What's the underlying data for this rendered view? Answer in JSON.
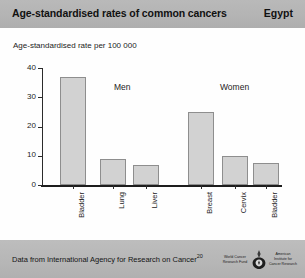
{
  "header": {
    "title": "Age-standardised rates of common cancers",
    "country": "Egypt"
  },
  "footer": {
    "note_text": "Data from International Agency for Research on Cancer",
    "note_superscript": "20",
    "logo_left": "World Cancer Research Fund",
    "logo_right": "American Institute for Cancer Research",
    "logo_emblem_name": "wcrf-aicr-emblem"
  },
  "colors": {
    "header_band": "#b4b4b4",
    "footer_band": "#b6b6b6",
    "bar_fill": "#d2d2d2",
    "bar_border": "#8e8e8e",
    "axis": "#2b2b2b",
    "plot_background": "#fefefe"
  },
  "chart_data": {
    "type": "bar",
    "title": "Age-standardised rates of common cancers",
    "subtitle": "Egypt",
    "ylabel": "Age-standardised rate per 100 000",
    "xlabel": "",
    "ylim": [
      0,
      40
    ],
    "yticks": [
      0,
      10,
      20,
      30,
      40
    ],
    "ytick_labels": [
      "0",
      "10",
      "20",
      "30",
      "40"
    ],
    "grid": false,
    "legend": "none",
    "group_labels": [
      "Men",
      "Women"
    ],
    "categories": [
      "Bladder",
      "Lung",
      "Liver",
      "Breast",
      "Cervix",
      "Bladder"
    ],
    "values": [
      37,
      9,
      7,
      25,
      10,
      7.5
    ],
    "groups": [
      {
        "name": "Men",
        "categories": [
          "Bladder",
          "Lung",
          "Liver"
        ],
        "values": [
          37,
          9,
          7
        ]
      },
      {
        "name": "Women",
        "categories": [
          "Breast",
          "Cervix",
          "Bladder"
        ],
        "values": [
          25,
          10,
          7.5
        ]
      }
    ],
    "bars": [
      {
        "label": "Bladder",
        "value": 37,
        "group": "Men",
        "x": 18
      },
      {
        "label": "Lung",
        "value": 9,
        "group": "Men",
        "x": 58
      },
      {
        "label": "Liver",
        "value": 7,
        "group": "Men",
        "x": 91
      },
      {
        "label": "Breast",
        "value": 25,
        "group": "Women",
        "x": 146
      },
      {
        "label": "Cervix",
        "value": 10,
        "group": "Women",
        "x": 180
      },
      {
        "label": "Bladder",
        "value": 7.5,
        "group": "Women",
        "x": 211
      }
    ],
    "annotations": [
      {
        "text": "Men",
        "x": 72,
        "y": 14
      },
      {
        "text": "Women",
        "x": 178,
        "y": 14
      }
    ],
    "source": "Data from International Agency for Research on Cancer"
  }
}
